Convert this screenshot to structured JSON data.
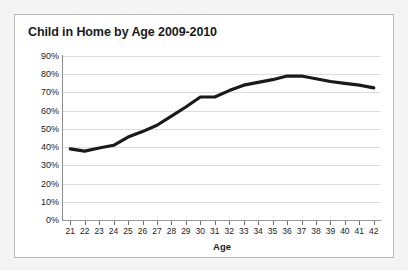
{
  "chart_data": {
    "type": "line",
    "title": "Child in Home by Age 2009-2010",
    "xlabel": "Age",
    "ylabel": "",
    "xlim": [
      21,
      42
    ],
    "ylim": [
      0,
      90
    ],
    "grid": true,
    "legend": "none",
    "line_color": "#1a1a1a",
    "gridline_color": "#dcdcdc",
    "axis_color": "#8c8c8c",
    "categories": [
      21,
      22,
      23,
      24,
      25,
      26,
      27,
      28,
      29,
      30,
      31,
      32,
      33,
      34,
      35,
      36,
      37,
      38,
      39,
      40,
      41,
      42
    ],
    "x_tick_labels": [
      "21",
      "22",
      "23",
      "24",
      "25",
      "26",
      "27",
      "28",
      "29",
      "30",
      "31",
      "32",
      "33",
      "34",
      "35",
      "36",
      "37",
      "38",
      "39",
      "40",
      "41",
      "42"
    ],
    "y_tick_values": [
      90,
      80,
      70,
      60,
      50,
      40,
      30,
      20,
      10,
      0
    ],
    "y_tick_labels": [
      "90%",
      "80%",
      "70%",
      "60%",
      "50%",
      "40%",
      "30%",
      "20%",
      "10%",
      "0%"
    ],
    "series": [
      {
        "name": "Child in Home",
        "values": [
          39,
          37.8,
          39.5,
          41,
          45.5,
          48.5,
          52,
          57,
          62,
          67.5,
          67.5,
          71,
          74,
          75.5,
          77,
          79,
          79,
          77.5,
          76,
          75,
          74,
          72.5
        ]
      }
    ]
  },
  "title": {
    "text": "Child in Home by Age 2009-2010"
  },
  "axis": {
    "x_title": "Age"
  }
}
